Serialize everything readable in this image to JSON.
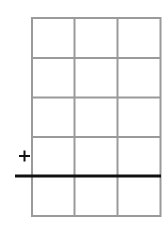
{
  "grid": {
    "columns": 3,
    "rows": 5,
    "x_lines": [
      32,
      74.5,
      117.5,
      160.5
    ],
    "y_lines": [
      18,
      58,
      97.5,
      137,
      176,
      216
    ],
    "line_color": "#9a9a9a"
  },
  "operator": {
    "symbol": "+",
    "meaning": "addition"
  },
  "sum_line": {
    "y": 176,
    "x_start": 15,
    "x_end": 161,
    "color": "#111111"
  }
}
